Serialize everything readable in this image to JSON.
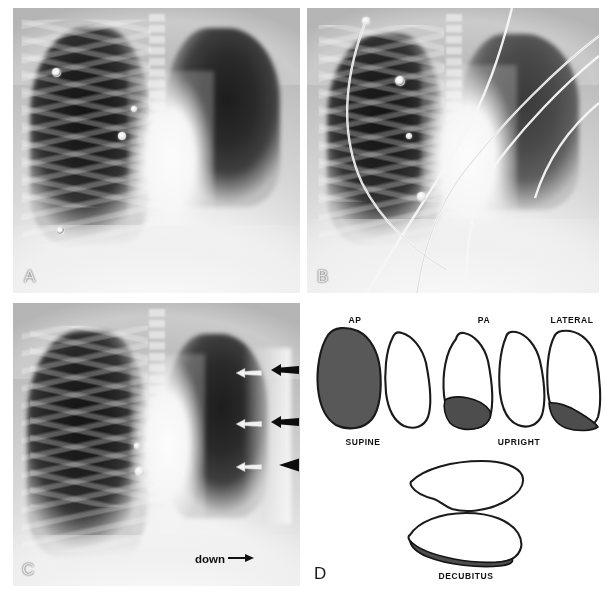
{
  "figure": {
    "panels": [
      {
        "id": "A",
        "letter": "A",
        "modality": "chest-radiograph",
        "view": "supine AP",
        "description": "Supine AP chest radiograph, right hemithorax with diffuse veil-like opacity of layering pleural effusion",
        "markers": [
          "ecg-electrode",
          "ecg-electrode",
          "ecg-electrode",
          "ecg-electrode"
        ]
      },
      {
        "id": "B",
        "letter": "B",
        "modality": "chest-radiograph",
        "view": "supine AP with lines",
        "description": "Supine AP chest radiograph with monitoring leads and catheters overlying the thorax",
        "markers": [
          "ecg-electrode",
          "ecg-electrode",
          "ecg-electrode",
          "catheter-line",
          "lead-wire"
        ]
      },
      {
        "id": "C",
        "letter": "C",
        "modality": "chest-radiograph",
        "view": "decubitus",
        "description": "Lateral decubitus chest radiograph; arrows mark the dependent layering pleural fluid along the lateral chest wall",
        "annotation_label": "down",
        "annotation_arrow": "right-arrow",
        "arrows": [
          {
            "style": "black-solid",
            "direction": "left",
            "name": "black-arrow-upper"
          },
          {
            "style": "white-open",
            "direction": "left",
            "name": "white-arrow-upper"
          },
          {
            "style": "black-solid",
            "direction": "left",
            "name": "black-arrow-middle"
          },
          {
            "style": "white-open",
            "direction": "left",
            "name": "white-arrow-middle"
          },
          {
            "style": "black-triangle",
            "direction": "left",
            "name": "black-arrowhead-lower"
          },
          {
            "style": "white-open",
            "direction": "left",
            "name": "white-arrow-lower"
          }
        ]
      },
      {
        "id": "D",
        "letter": "D",
        "modality": "line-diagram",
        "view": "schematic",
        "description": "Schematic diagram of pleural fluid distribution in supine, upright and decubitus positions"
      }
    ]
  },
  "diagram": {
    "rows": [
      {
        "name": "supine-row",
        "position_label": "SUPINE",
        "views": [
          {
            "label": "AP",
            "name": "ap-view",
            "effusion": "diffuse-whole-lung"
          },
          {
            "label": "",
            "name": "ap-contralateral-view",
            "effusion": "none"
          }
        ]
      },
      {
        "name": "upright-row",
        "position_label": "UPRIGHT",
        "views": [
          {
            "label": "PA",
            "name": "pa-view",
            "effusion": "basal-meniscus"
          },
          {
            "label": "",
            "name": "pa-contralateral-view",
            "effusion": "none"
          },
          {
            "label": "LATERAL",
            "name": "lateral-view",
            "effusion": "posterior-basal"
          }
        ]
      },
      {
        "name": "decubitus-row",
        "position_label": "DECUBITUS",
        "views": [
          {
            "label": "",
            "name": "decubitus-upper-lung",
            "effusion": "none"
          },
          {
            "label": "",
            "name": "decubitus-dependent-lung",
            "effusion": "dependent-layering"
          }
        ]
      }
    ]
  }
}
